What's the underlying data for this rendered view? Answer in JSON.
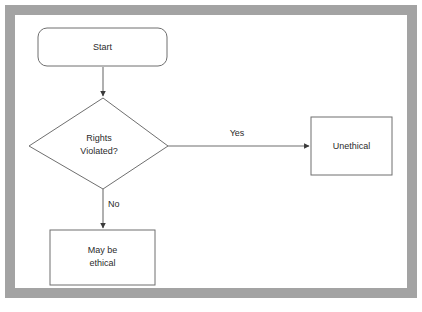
{
  "diagram": {
    "frame_color": "#a3a3a3",
    "background_color": "#ffffff",
    "shape_stroke_color": "#6f6f6f",
    "text_color": "#2b2b2b",
    "nodes": [
      {
        "id": "start",
        "shape": "rounded-rectangle",
        "label": "Start",
        "lines": [
          "Start"
        ]
      },
      {
        "id": "decision",
        "shape": "diamond",
        "label": "Rights Violated?",
        "lines": [
          "Rights",
          "Violated?"
        ]
      },
      {
        "id": "unethical",
        "shape": "rectangle",
        "label": "Unethical",
        "lines": [
          "Unethical"
        ]
      },
      {
        "id": "may-be-ethical",
        "shape": "rectangle",
        "label": "May be ethical",
        "lines": [
          "May be",
          "ethical"
        ]
      }
    ],
    "edges": [
      {
        "id": "start-to-decision",
        "from": "start",
        "to": "decision",
        "label": "",
        "direction": "down"
      },
      {
        "id": "decision-to-unethical",
        "from": "decision",
        "to": "unethical",
        "label": "Yes",
        "direction": "right"
      },
      {
        "id": "decision-to-may-be-ethical",
        "from": "decision",
        "to": "may-be-ethical",
        "label": "No",
        "direction": "down"
      }
    ]
  }
}
